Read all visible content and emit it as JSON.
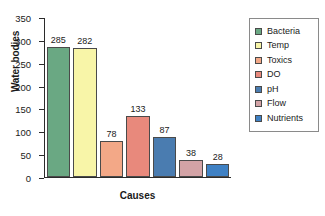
{
  "chart_data": {
    "type": "bar",
    "title": "",
    "xlabel": "Causes",
    "ylabel": "Water bodies",
    "categories": [
      "Bacteria",
      "Temp",
      "Toxics",
      "DO",
      "pH",
      "Flow",
      "Nutrients"
    ],
    "values": [
      285,
      282,
      78,
      133,
      87,
      38,
      28
    ],
    "value_labels": [
      "285",
      "282",
      "78",
      "133",
      "87",
      "38",
      "28"
    ],
    "colors": [
      "#6aa883",
      "#f8f5a8",
      "#f3a887",
      "#e8897c",
      "#4a7cb0",
      "#d3a3a6",
      "#3f81c4"
    ],
    "ylim": [
      0,
      350
    ],
    "yticks": [
      0,
      50,
      100,
      150,
      200,
      250,
      300,
      350
    ],
    "ytick_labels": [
      "0",
      "50",
      "100",
      "150",
      "200",
      "250",
      "300",
      "350"
    ],
    "xtick_labels": [],
    "grid": false,
    "legend_position": "right",
    "legend_entries": [
      {
        "label": "Bacteria",
        "color": "#6aa883"
      },
      {
        "label": "Temp",
        "color": "#f8f5a8"
      },
      {
        "label": "Toxics",
        "color": "#f3a887"
      },
      {
        "label": "DO",
        "color": "#e8897c"
      },
      {
        "label": "pH",
        "color": "#4a7cb0"
      },
      {
        "label": "Flow",
        "color": "#d3a3a6"
      },
      {
        "label": "Nutrients",
        "color": "#3f81c4"
      }
    ]
  }
}
